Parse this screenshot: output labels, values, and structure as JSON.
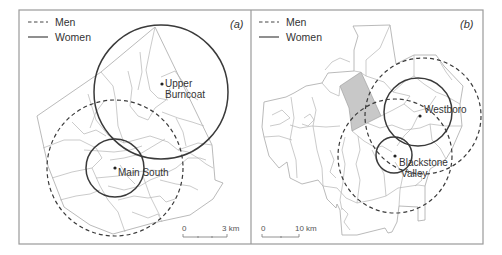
{
  "figure": {
    "legend": {
      "men_label": "Men",
      "women_label": "Women",
      "men_style": "dashed",
      "women_style": "solid"
    },
    "panels": [
      {
        "tag": "(a)",
        "places": [
          {
            "name_line1": "Upper",
            "name_line2": "Burncoat"
          },
          {
            "name_line1": "Main South"
          }
        ],
        "scale": {
          "start": "0",
          "end": "3 km"
        }
      },
      {
        "tag": "(b)",
        "places": [
          {
            "name_line1": "Westboro"
          },
          {
            "name_line1": "Blackstone",
            "name_line2": "Valley"
          }
        ],
        "scale": {
          "start": "0",
          "end": "10 km"
        }
      }
    ],
    "colors": {
      "circle": "#3a3a3a",
      "boundary": "#b4b4b4",
      "shaded_area": "#c8c8c8",
      "frame": "#9a9a9a"
    }
  }
}
